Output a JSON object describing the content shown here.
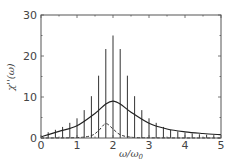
{
  "chart_data": {
    "type": "line",
    "title": "",
    "xlabel": "ω/ω₀",
    "ylabel": "χ''(ω)",
    "xlim": [
      0,
      5
    ],
    "ylim": [
      0,
      30
    ],
    "xticks": [
      0,
      1,
      2,
      3,
      4,
      5
    ],
    "yticks": [
      0,
      10,
      20,
      30
    ],
    "grid": false,
    "legend": null,
    "series": [
      {
        "name": "spectral lines (sticks)",
        "style": "vertical-lines",
        "x": [
          0.2,
          0.4,
          0.6,
          0.8,
          1.0,
          1.2,
          1.4,
          1.6,
          1.8,
          2.0,
          2.2,
          2.4,
          2.6,
          2.8,
          3.0,
          3.2,
          3.4,
          3.6,
          3.8,
          4.0,
          4.2,
          4.4,
          4.6,
          4.8
        ],
        "values": [
          1.4,
          2.0,
          2.7,
          3.7,
          4.8,
          6.8,
          10.2,
          15.2,
          21.7,
          25.0,
          21.7,
          15.2,
          10.2,
          6.8,
          4.8,
          3.7,
          2.7,
          2.0,
          1.6,
          1.3,
          1.1,
          0.9,
          0.8,
          0.7
        ]
      },
      {
        "name": "envelope (solid)",
        "style": "solid",
        "x": [
          0,
          0.5,
          1.0,
          1.5,
          1.8,
          2.0,
          2.2,
          2.5,
          3.0,
          3.5,
          4.0,
          4.5,
          5.0
        ],
        "values": [
          0.3,
          1.6,
          3.0,
          6.0,
          8.3,
          9.0,
          8.3,
          6.3,
          3.6,
          2.2,
          1.5,
          1.1,
          0.8
        ]
      },
      {
        "name": "secondary peak (dashed)",
        "style": "dashed",
        "x": [
          0,
          1.0,
          1.4,
          1.6,
          1.8,
          2.0,
          2.2,
          2.5,
          3.0,
          5.0
        ],
        "values": [
          0,
          0.1,
          0.6,
          1.8,
          3.5,
          2.2,
          0.8,
          0.2,
          0.05,
          0
        ]
      }
    ]
  },
  "axes": {
    "x_tick_labels": [
      "0",
      "1",
      "2",
      "3",
      "4",
      "5"
    ],
    "y_tick_labels": [
      "0",
      "10",
      "20",
      "30"
    ],
    "xlabel": "ω/ω",
    "xlabel_sub": "0",
    "ylabel": "χ''(ω)"
  }
}
